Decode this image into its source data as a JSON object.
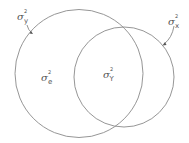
{
  "diagram": {
    "type": "venn",
    "stroke_color": "#8a8a8a",
    "label_color": "#555555",
    "circles": [
      {
        "id": "large",
        "cx": 79,
        "cy": 73.5,
        "r": 64
      },
      {
        "id": "small",
        "cx": 124,
        "cy": 77,
        "r": 50
      }
    ],
    "labels": {
      "y_total": {
        "base": "σ",
        "sup": "2",
        "sub": "y"
      },
      "x_total": {
        "base": "σ",
        "sup": "2",
        "sub": "x"
      },
      "error": {
        "base": "σ",
        "sup": "2",
        "sub": "e"
      },
      "shared": {
        "base": "σ",
        "sup": "2",
        "sub": "Y"
      }
    }
  }
}
